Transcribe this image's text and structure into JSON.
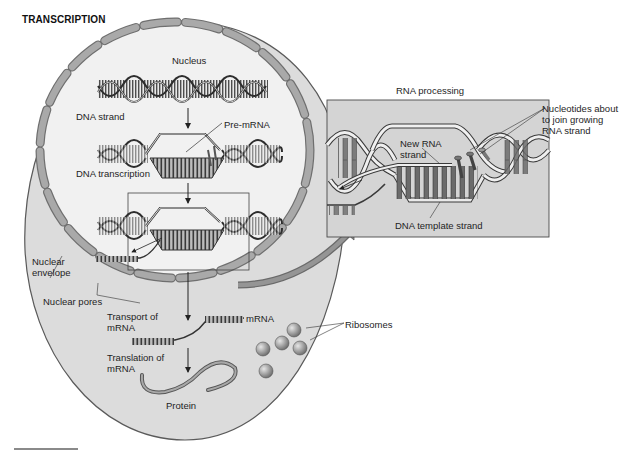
{
  "title": "TRANSCRIPTION",
  "labels": {
    "nucleus": "Nucleus",
    "dna_strand": "DNA strand",
    "pre_mrna": "Pre-mRNA",
    "dna_transcription": "DNA transcription",
    "nuclear_envelope": "Nuclear\nenvelope",
    "nuclear_pores": "Nuclear pores",
    "transport_of_mrna": "Transport of\nmRNA",
    "mrna": "mRNA",
    "translation_of_mrna": "Translation of\nmRNA",
    "protein": "Protein",
    "ribosomes": "Ribosomes"
  },
  "inset": {
    "title": "RNA processing",
    "new_rna_strand": "New RNA\nstrand",
    "dna_template_strand": "DNA template strand",
    "nucleotides": "Nucleotides about\nto join growing\nRNA strand"
  },
  "colors": {
    "cytoplasm": "#dcdcdc",
    "nucleoplasm": "#f1f1f1",
    "envelope": "#a9a9a9",
    "envelope_stroke": "#6f6f6f",
    "inset_bg": "#d4d4d4",
    "dna_dark": "#4a4a4a",
    "ribosome": "#9a9a9a",
    "arrow_big": "#8a8a8a"
  }
}
